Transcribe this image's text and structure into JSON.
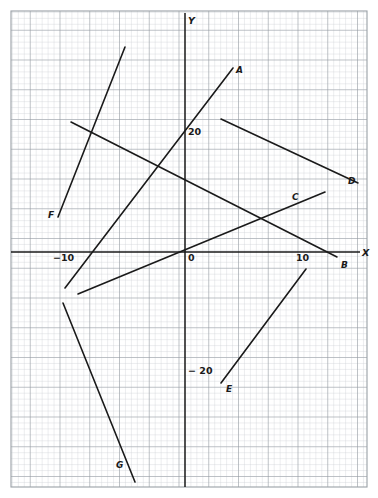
{
  "figure": {
    "background_color": "#ffffff",
    "grid": {
      "minor_color": "#c9cdd2",
      "major_color": "#8f969d",
      "minor_step_px": 5.95,
      "major_every": 5,
      "plot_left": 11,
      "plot_top": 11,
      "plot_right": 367,
      "plot_bottom": 487,
      "border_color": "#9aa0a6"
    },
    "axes": {
      "color": "#1a1a1a",
      "origin_px": [
        185,
        252
      ],
      "px_per_unit_x": 11.9,
      "px_per_unit_y": 11.9,
      "x_axis_label": "X",
      "y_axis_label": "Y",
      "x_axis_label_pos_px": [
        362,
        248
      ],
      "y_axis_label_pos_px": [
        188,
        16
      ],
      "xlim": [
        -14.6,
        15.3
      ],
      "ylim": [
        -19.7,
        20.3
      ]
    },
    "tick_labels": [
      {
        "text": "−10",
        "axis": "x",
        "value": -10,
        "pos_px": [
          53,
          253
        ]
      },
      {
        "text": "0",
        "axis": "x",
        "value": 0,
        "pos_px": [
          188,
          253
        ]
      },
      {
        "text": "10",
        "axis": "x",
        "value": 10,
        "pos_px": [
          296,
          253
        ]
      },
      {
        "text": "20",
        "axis": "y",
        "value": 20,
        "pos_px": [
          188,
          127
        ]
      },
      {
        "text": "− 20",
        "axis": "y",
        "value": -20,
        "pos_px": [
          188,
          366
        ]
      }
    ]
  },
  "chart_data": {
    "type": "line",
    "title": "",
    "xlabel": "X",
    "ylabel": "Y",
    "xlim": [
      -14.6,
      15.3
    ],
    "ylim": [
      -19.7,
      20.3
    ],
    "grid": true,
    "legend": "none",
    "line_color": "#1a1a1a",
    "line_width_px": 1.6,
    "series": [
      {
        "name": "A",
        "label": "A",
        "label_pos_px": [
          236,
          66
        ],
        "endpoints_px": [
          [
            65,
            288
          ],
          [
            233,
            68
          ]
        ],
        "endpoints_data": [
          [
            -10.1,
            -3.0
          ],
          [
            4.0,
            15.5
          ]
        ],
        "slope": 1.31,
        "intercept": 10.3
      },
      {
        "name": "B",
        "label": "B",
        "label_pos_px": [
          341,
          261
        ],
        "endpoints_px": [
          [
            71,
            122
          ],
          [
            337,
            257
          ]
        ],
        "endpoints_data": [
          [
            -9.6,
            10.9
          ],
          [
            12.8,
            -0.4
          ]
        ],
        "slope": -0.505,
        "intercept": 6.1
      },
      {
        "name": "C",
        "label": "C",
        "label_pos_px": [
          292,
          193
        ],
        "endpoints_px": [
          [
            78,
            294
          ],
          [
            325,
            192
          ]
        ],
        "endpoints_data": [
          [
            -9.0,
            -3.5
          ],
          [
            11.8,
            5.0
          ]
        ],
        "slope": 0.41,
        "intercept": 0.2
      },
      {
        "name": "D",
        "label": "D",
        "label_pos_px": [
          348,
          177
        ],
        "endpoints_px": [
          [
            221,
            119
          ],
          [
            358,
            183
          ]
        ],
        "endpoints_data": [
          [
            3.0,
            11.2
          ],
          [
            14.5,
            5.8
          ]
        ],
        "slope": -0.47,
        "intercept": 12.6
      },
      {
        "name": "E",
        "label": "E",
        "label_pos_px": [
          226,
          385
        ],
        "endpoints_px": [
          [
            221,
            383
          ],
          [
            306,
            269
          ]
        ],
        "endpoints_data": [
          [
            3.0,
            -11.0
          ],
          [
            10.2,
            -1.4
          ]
        ],
        "slope": 1.34,
        "intercept": -15.0
      },
      {
        "name": "F",
        "label": "F",
        "label_pos_px": [
          48,
          211
        ],
        "endpoints_px": [
          [
            58,
            217
          ],
          [
            125,
            47
          ]
        ],
        "endpoints_data": [
          [
            -10.7,
            2.9
          ],
          [
            -5.0,
            17.2
          ]
        ],
        "slope": 2.54,
        "intercept": 30.1
      },
      {
        "name": "G",
        "label": "G",
        "label_pos_px": [
          116,
          461
        ],
        "endpoints_px": [
          [
            63,
            303
          ],
          [
            135,
            482
          ]
        ],
        "endpoints_data": [
          [
            -10.3,
            -4.3
          ],
          [
            -4.2,
            -19.3
          ]
        ],
        "slope": -2.49,
        "intercept": -29.8
      }
    ]
  }
}
